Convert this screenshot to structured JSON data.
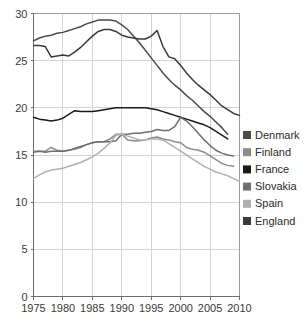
{
  "chart_data": {
    "type": "line",
    "title": "",
    "subtitle": "",
    "xlabel": "",
    "ylabel": "",
    "xlim": [
      1975,
      2010
    ],
    "ylim": [
      0,
      30
    ],
    "xticks": [
      1975,
      1980,
      1985,
      1990,
      1995,
      2000,
      2005,
      2010
    ],
    "yticks": [
      0,
      5,
      10,
      15,
      20,
      25,
      30
    ],
    "xtick_labels": [
      "1975",
      "1980",
      "1985",
      "1990",
      "1995",
      "2000",
      "2005",
      "2010"
    ],
    "ytick_labels": [
      "0",
      "5",
      "10",
      "15",
      "20",
      "25",
      "30"
    ],
    "grid": true,
    "legend_position": "right",
    "series": [
      {
        "name": "Denmark",
        "color": "#4a4a4a",
        "x": [
          1975,
          1976,
          1977,
          1978,
          1979,
          1980,
          1981,
          1982,
          1983,
          1984,
          1985,
          1986,
          1987,
          1988,
          1989,
          1990,
          1991,
          1992,
          1993,
          1994,
          1995,
          1996,
          1997,
          1998,
          1999,
          2000,
          2001,
          2002,
          2003,
          2004,
          2005,
          2006,
          2007,
          2008
        ],
        "values": [
          27.1,
          27.4,
          27.6,
          27.7,
          27.9,
          28.0,
          28.2,
          28.4,
          28.6,
          28.9,
          29.1,
          29.3,
          29.3,
          29.3,
          29.2,
          28.8,
          28.3,
          27.6,
          26.9,
          26.1,
          25.3,
          24.5,
          23.7,
          23.0,
          22.4,
          21.9,
          21.3,
          20.8,
          20.2,
          19.6,
          19.1,
          18.5,
          17.9,
          17.2
        ]
      },
      {
        "name": "Finland",
        "color": "#8c8c8c",
        "x": [
          1975,
          1976,
          1977,
          1978,
          1979,
          1980,
          1981,
          1982,
          1983,
          1984,
          1985,
          1986,
          1987,
          1988,
          1989,
          1990,
          1991,
          1992,
          1993,
          1994,
          1995,
          1996,
          1997,
          1998,
          1999,
          2000,
          2001,
          2002,
          2003,
          2004,
          2005,
          2006,
          2007,
          2008,
          2009
        ],
        "values": [
          15.4,
          15.4,
          15.4,
          15.8,
          15.5,
          15.4,
          15.5,
          15.6,
          15.8,
          16.1,
          16.3,
          16.4,
          16.4,
          16.7,
          17.2,
          17.2,
          16.6,
          16.5,
          16.5,
          16.6,
          16.8,
          16.9,
          16.7,
          16.6,
          16.4,
          16.3,
          15.8,
          15.6,
          15.5,
          15.3,
          14.9,
          14.5,
          14.1,
          13.9,
          13.8
        ]
      },
      {
        "name": "France",
        "color": "#1a1a1a",
        "x": [
          1975,
          1976,
          1977,
          1978,
          1979,
          1980,
          1981,
          1982,
          1983,
          1984,
          1985,
          1986,
          1987,
          1988,
          1989,
          1990,
          1991,
          1992,
          1993,
          1994,
          1995,
          1996,
          1997,
          1998,
          1999,
          2000,
          2001,
          2002,
          2003,
          2004,
          2005,
          2006,
          2007,
          2008
        ],
        "values": [
          19.0,
          18.8,
          18.7,
          18.6,
          18.7,
          18.9,
          19.3,
          19.7,
          19.6,
          19.6,
          19.6,
          19.7,
          19.8,
          19.9,
          20.0,
          20.0,
          20.0,
          20.0,
          20.0,
          20.0,
          19.9,
          19.8,
          19.6,
          19.4,
          19.2,
          19.0,
          18.8,
          18.6,
          18.4,
          18.2,
          17.9,
          17.5,
          17.1,
          16.7
        ]
      },
      {
        "name": "Slovakia",
        "color": "#6e6e6e",
        "x": [
          1975,
          1976,
          1977,
          1978,
          1979,
          1980,
          1981,
          1982,
          1983,
          1984,
          1985,
          1986,
          1987,
          1988,
          1989,
          1990,
          1991,
          1992,
          1993,
          1994,
          1995,
          1996,
          1997,
          1998,
          1999,
          2000,
          2001,
          2002,
          2003,
          2004,
          2005,
          2006,
          2007,
          2008,
          2009
        ],
        "values": [
          15.3,
          15.4,
          15.3,
          15.4,
          15.4,
          15.4,
          15.5,
          15.7,
          15.9,
          16.1,
          16.3,
          16.4,
          16.4,
          16.4,
          16.5,
          17.2,
          17.2,
          17.3,
          17.3,
          17.4,
          17.5,
          17.7,
          17.6,
          17.6,
          18.0,
          19.0,
          18.6,
          18.0,
          17.3,
          16.6,
          16.0,
          15.5,
          15.2,
          15.0,
          14.9
        ]
      },
      {
        "name": "Spain",
        "color": "#b0b0b0",
        "x": [
          1975,
          1976,
          1977,
          1978,
          1979,
          1980,
          1981,
          1982,
          1983,
          1984,
          1985,
          1986,
          1987,
          1988,
          1989,
          1990,
          1991,
          1992,
          1993,
          1994,
          1995,
          1996,
          1997,
          1998,
          1999,
          2000,
          2001,
          2002,
          2003,
          2004,
          2005,
          2006,
          2007,
          2008,
          2009,
          2010
        ],
        "values": [
          12.5,
          12.9,
          13.2,
          13.4,
          13.5,
          13.6,
          13.8,
          14.0,
          14.2,
          14.5,
          14.8,
          15.2,
          15.7,
          16.3,
          17.1,
          17.2,
          17.0,
          16.8,
          16.6,
          16.6,
          16.7,
          16.7,
          16.6,
          16.2,
          15.8,
          15.4,
          15.0,
          14.6,
          14.2,
          13.8,
          13.5,
          13.2,
          13.0,
          12.8,
          12.5,
          12.2
        ]
      },
      {
        "name": "England",
        "color": "#3a3a3a",
        "x": [
          1975,
          1976,
          1977,
          1978,
          1979,
          1980,
          1981,
          1982,
          1983,
          1984,
          1985,
          1986,
          1987,
          1988,
          1989,
          1990,
          1991,
          1992,
          1993,
          1994,
          1995,
          1996,
          1997,
          1998,
          1999,
          2000,
          2001,
          2002,
          2003,
          2004,
          2005,
          2006,
          2007,
          2008,
          2009,
          2010
        ],
        "values": [
          26.6,
          26.6,
          26.5,
          25.4,
          25.5,
          25.6,
          25.5,
          25.9,
          26.4,
          27.0,
          27.6,
          28.1,
          28.3,
          28.3,
          28.1,
          27.7,
          27.5,
          27.4,
          27.3,
          27.3,
          27.6,
          28.2,
          26.5,
          25.4,
          25.2,
          24.5,
          23.7,
          23.0,
          22.4,
          21.9,
          21.4,
          20.8,
          20.2,
          19.8,
          19.4,
          19.2
        ]
      }
    ],
    "legend": [
      {
        "label": "Denmark",
        "swatch": "#4a4a4a"
      },
      {
        "label": "Finland",
        "swatch": "#8c8c8c"
      },
      {
        "label": "France",
        "swatch": "#1a1a1a"
      },
      {
        "label": "Slovakia",
        "swatch": "#6e6e6e"
      },
      {
        "label": "Spain",
        "swatch": "#b0b0b0"
      },
      {
        "label": "England",
        "swatch": "#3a3a3a"
      }
    ]
  }
}
